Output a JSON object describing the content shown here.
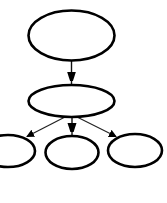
{
  "diagram": {
    "type": "tree",
    "background": "#ffffff",
    "stroke_color": "#000000",
    "nodes": [
      {
        "id": "root",
        "label": "",
        "cx": 71.5,
        "cy": 35.5,
        "rx": 43,
        "ry": 25
      },
      {
        "id": "child",
        "label": "",
        "cx": 71.5,
        "cy": 101,
        "rx": 43,
        "ry": 16
      },
      {
        "id": "leaf-left",
        "label": "",
        "cx": 8,
        "cy": 151,
        "rx": 27,
        "ry": 16
      },
      {
        "id": "leaf-middle",
        "label": "",
        "cx": 72,
        "cy": 152.5,
        "rx": 26.5,
        "ry": 16.5
      },
      {
        "id": "leaf-right",
        "label": "",
        "cx": 135,
        "cy": 150.5,
        "rx": 27,
        "ry": 16.5
      }
    ],
    "edges": [
      {
        "from": "root",
        "to": "child",
        "directed": true
      },
      {
        "from": "child",
        "to": "leaf-left",
        "directed": true
      },
      {
        "from": "child",
        "to": "leaf-middle",
        "directed": true
      },
      {
        "from": "child",
        "to": "leaf-right",
        "directed": true
      }
    ]
  }
}
